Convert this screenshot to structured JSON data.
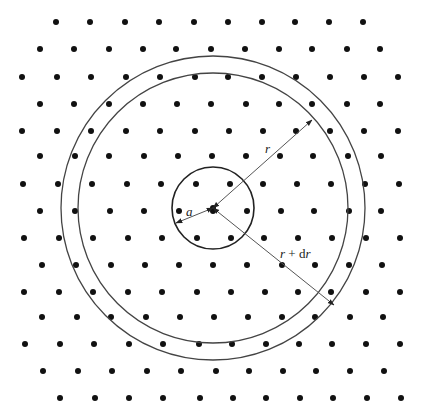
{
  "diagram": {
    "title": "",
    "type": "lattice with concentric circles",
    "background": "#ffffff",
    "ink_color": "#111111",
    "line_color": "#555555",
    "center": {
      "x": 213,
      "y": 208
    },
    "lattice": {
      "rows": [
        {
          "y": 22,
          "xs": [
            56,
            90,
            125,
            159,
            194,
            228,
            262,
            295,
            329,
            363
          ]
        },
        {
          "y": 49,
          "xs": [
            40,
            74,
            109,
            143,
            176,
            211,
            245,
            279,
            312,
            347,
            380
          ]
        },
        {
          "y": 77,
          "xs": [
            22,
            57,
            91,
            126,
            160,
            195,
            228,
            262,
            296,
            330,
            364,
            398
          ]
        },
        {
          "y": 104,
          "xs": [
            40,
            74,
            109,
            143,
            177,
            211,
            246,
            279,
            312,
            347,
            380
          ]
        },
        {
          "y": 131,
          "xs": [
            22,
            57,
            91,
            126,
            160,
            195,
            229,
            263,
            296,
            330,
            364,
            398
          ]
        },
        {
          "y": 156,
          "xs": [
            40,
            75,
            109,
            144,
            178,
            212,
            246,
            280,
            313,
            348,
            381
          ]
        },
        {
          "y": 184,
          "xs": [
            23,
            58,
            92,
            127,
            161,
            196,
            230,
            263,
            297,
            331,
            365,
            399
          ]
        },
        {
          "y": 211,
          "xs": [
            40,
            75,
            110,
            144,
            179,
            213,
            247,
            281,
            314,
            349,
            381
          ]
        },
        {
          "y": 238,
          "xs": [
            24,
            59,
            93,
            128,
            162,
            197,
            231,
            264,
            298,
            332,
            366,
            400
          ]
        },
        {
          "y": 265,
          "xs": [
            42,
            76,
            111,
            145,
            179,
            213,
            247,
            282,
            315,
            349,
            382
          ]
        },
        {
          "y": 292,
          "xs": [
            24,
            59,
            93,
            128,
            162,
            197,
            231,
            265,
            298,
            331,
            366,
            400
          ]
        },
        {
          "y": 317,
          "xs": [
            42,
            77,
            111,
            146,
            180,
            214,
            248,
            282,
            315,
            350,
            383
          ]
        },
        {
          "y": 344,
          "xs": [
            25,
            60,
            94,
            129,
            163,
            199,
            232,
            266,
            299,
            332,
            366,
            400
          ]
        },
        {
          "y": 371,
          "xs": [
            43,
            78,
            112,
            147,
            181,
            216,
            249,
            283,
            316,
            350,
            384
          ]
        },
        {
          "y": 398,
          "xs": [
            60,
            95,
            129,
            163,
            200,
            233,
            266,
            300,
            333,
            367,
            401
          ]
        }
      ],
      "dot_radius": 3
    },
    "circles": [
      {
        "name": "small-circle",
        "r": 41
      },
      {
        "name": "inner-ring",
        "r": 135
      },
      {
        "name": "outer-ring",
        "r": 152
      }
    ],
    "arrows": [
      {
        "name": "radius-a-arrow",
        "from": [
          213,
          208
        ],
        "to": [
          176,
          223
        ],
        "label": "a",
        "label_pos": [
          188,
          213
        ]
      },
      {
        "name": "radius-r-arrow",
        "from": [
          213,
          208
        ],
        "to": [
          312,
          120
        ],
        "label": "r",
        "label_pos": [
          265,
          153
        ]
      },
      {
        "name": "radius-r-plus-dr-arrow",
        "from": [
          213,
          208
        ],
        "to": [
          334,
          305
        ],
        "label": "r + dr",
        "label_pos": [
          282,
          256
        ]
      }
    ],
    "labels": {
      "a": "a",
      "r": "r",
      "r_plus_dr_prefix": "r",
      "r_plus_dr_mid": " + d",
      "r_plus_dr_suffix": "r"
    }
  }
}
